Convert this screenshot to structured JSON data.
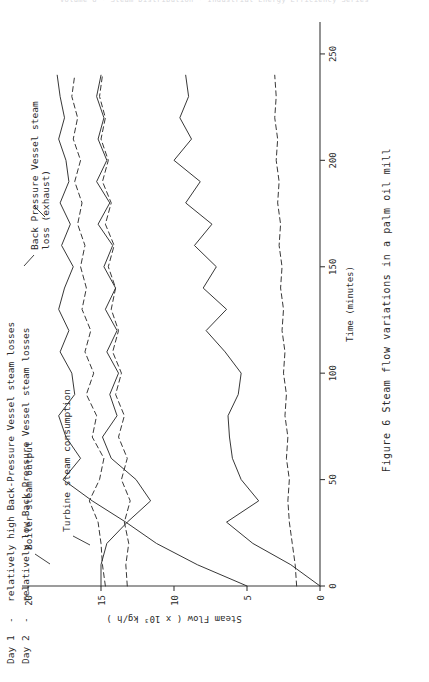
{
  "header_strip": {
    "text": "Volume 6 · Steam Distribution · Industrial Energy Efficiency Series"
  },
  "figure": {
    "caption_number": "Figure 6",
    "caption_text": "Steam flow variations in a palm oil mill"
  },
  "legend": {
    "entries": [
      {
        "key": "Day 1",
        "dash": "-",
        "text": "relatively high Back-Pressure Vessel steam losses"
      },
      {
        "key": "Day 2",
        "dash": "-",
        "text": "relatively low Back-Pressure Vessel steam losses"
      }
    ]
  },
  "annotations": [
    {
      "id": "boiler",
      "text": "Boiler steam output"
    },
    {
      "id": "turbine",
      "text": "Turbine steam consumption"
    },
    {
      "id": "bpv_l1",
      "text": "Back Pressure Vessel steam"
    },
    {
      "id": "bpv_l2",
      "text": "loss (exhaust)"
    }
  ],
  "chart_data": {
    "type": "line",
    "title": "Steam flow variations in a palm oil mill",
    "xlabel": "Time (minutes)",
    "ylabel": "Steam Flow ( x 10³ kg/h )",
    "xlim": [
      0,
      265
    ],
    "ylim": [
      0,
      20
    ],
    "xticks": [
      0,
      50,
      100,
      150,
      200,
      250
    ],
    "yticks": [
      0,
      5,
      10,
      15,
      20
    ],
    "xtick_labels": [
      "0",
      "50",
      "100",
      "150",
      "200",
      "250"
    ],
    "ytick_labels": [
      "0",
      "5",
      "10",
      "15",
      "20"
    ],
    "grid": false,
    "legend_position": "upper-left-outside",
    "x": [
      0,
      10,
      20,
      30,
      40,
      50,
      60,
      70,
      80,
      90,
      100,
      110,
      120,
      130,
      140,
      150,
      160,
      170,
      180,
      190,
      200,
      210,
      220,
      230,
      240
    ],
    "series": [
      {
        "name": "Boiler steam output - Day 1",
        "style": "solid",
        "annotation": "Boiler steam output",
        "values": [
          5.0,
          8.4,
          11.2,
          13.3,
          15.6,
          17.6,
          16.4,
          17.4,
          17.9,
          16.8,
          17.0,
          17.8,
          17.2,
          17.9,
          17.5,
          16.9,
          17.7,
          17.1,
          17.8,
          17.2,
          17.4,
          17.9,
          17.5,
          17.8,
          18.0
        ]
      },
      {
        "name": "Boiler steam output - Day 2",
        "style": "dashed",
        "annotation": "Boiler steam output",
        "values": [
          14.7,
          14.9,
          15.0,
          15.2,
          15.8,
          15.1,
          14.8,
          15.6,
          15.3,
          16.0,
          15.5,
          16.1,
          15.7,
          16.3,
          16.0,
          16.4,
          16.1,
          16.6,
          16.3,
          16.8,
          16.4,
          16.9,
          16.6,
          17.0,
          16.8
        ]
      },
      {
        "name": "Turbine steam consumption - Day 1",
        "style": "solid",
        "annotation": "Turbine steam consumption",
        "values": [
          15.0,
          15.0,
          14.6,
          13.2,
          11.6,
          12.6,
          14.3,
          14.9,
          13.9,
          14.4,
          13.8,
          14.6,
          13.9,
          14.7,
          14.0,
          14.8,
          14.2,
          15.2,
          14.4,
          15.3,
          14.6,
          15.2,
          14.8,
          15.3,
          15.0
        ]
      },
      {
        "name": "Turbine steam consumption - Day 2",
        "style": "dashed",
        "annotation": "Turbine steam consumption",
        "values": [
          13.2,
          13.3,
          13.1,
          13.4,
          13.0,
          13.6,
          13.2,
          13.8,
          13.4,
          14.0,
          13.6,
          14.2,
          13.8,
          14.3,
          14.0,
          14.5,
          14.1,
          14.7,
          14.3,
          14.9,
          14.5,
          15.0,
          14.7,
          15.1,
          14.9
        ]
      },
      {
        "name": "Back Pressure Vessel steam loss (exhaust) - Day 1",
        "style": "solid",
        "annotation": "Back Pressure Vessel steam loss (exhaust)",
        "values": [
          0.0,
          2.0,
          4.6,
          6.4,
          4.2,
          5.4,
          6.0,
          6.2,
          6.3,
          5.6,
          5.4,
          6.5,
          7.8,
          6.4,
          8.0,
          7.1,
          8.6,
          7.4,
          9.2,
          8.2,
          10.0,
          8.8,
          9.6,
          9.0,
          9.2
        ]
      },
      {
        "name": "Back Pressure Vessel steam loss (exhaust) - Day 2",
        "style": "dashed",
        "annotation": "Back Pressure Vessel steam loss (exhaust)",
        "values": [
          1.6,
          1.7,
          1.9,
          2.1,
          2.2,
          2.1,
          2.3,
          2.2,
          2.4,
          2.3,
          2.5,
          2.4,
          2.6,
          2.5,
          2.7,
          2.6,
          2.8,
          2.7,
          2.9,
          2.8,
          3.0,
          2.9,
          3.1,
          3.0,
          3.1
        ]
      }
    ]
  }
}
